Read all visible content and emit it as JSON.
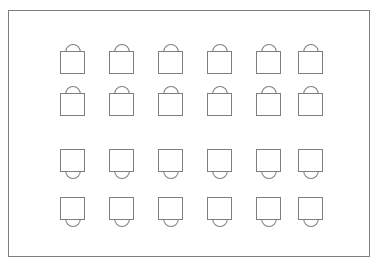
{
  "canvas": {
    "width": 380,
    "height": 269,
    "background_color": "#ffffff"
  },
  "frame": {
    "name": "outer-border-rectangle",
    "x": 8,
    "y": 10,
    "width": 362,
    "height": 247,
    "stroke_color": "#7f7f7f",
    "stroke_width": 1,
    "fill_color": "#ffffff"
  },
  "grid": {
    "rows": 4,
    "columns": 6,
    "total_icons": 24,
    "column_pitch": 49,
    "first_column_x": 60,
    "row_tops": [
      43,
      85,
      148,
      196
    ],
    "box_width": 23,
    "box_height": 21,
    "arc_width": 14,
    "arc_height": 7,
    "stroke_color": "#7f7f7f"
  },
  "icons": [
    {
      "row": 1,
      "column": 1,
      "name": "bag-icon-r1c1",
      "shape": "square-with-arc-above",
      "x": 60,
      "y": 43
    },
    {
      "row": 1,
      "column": 2,
      "name": "bag-icon-r1c2",
      "shape": "square-with-arc-above",
      "x": 109,
      "y": 43
    },
    {
      "row": 1,
      "column": 3,
      "name": "bag-icon-r1c3",
      "shape": "square-with-arc-above",
      "x": 158,
      "y": 43
    },
    {
      "row": 1,
      "column": 4,
      "name": "bag-icon-r1c4",
      "shape": "square-with-arc-above",
      "x": 207,
      "y": 43
    },
    {
      "row": 1,
      "column": 5,
      "name": "bag-icon-r1c5",
      "shape": "square-with-arc-above",
      "x": 256,
      "y": 43
    },
    {
      "row": 1,
      "column": 6,
      "name": "bag-icon-r1c6",
      "shape": "square-with-arc-above",
      "x": 298,
      "y": 43
    },
    {
      "row": 2,
      "column": 1,
      "name": "bag-icon-r2c1",
      "shape": "square-with-arc-above",
      "x": 60,
      "y": 85
    },
    {
      "row": 2,
      "column": 2,
      "name": "bag-icon-r2c2",
      "shape": "square-with-arc-above",
      "x": 109,
      "y": 85
    },
    {
      "row": 2,
      "column": 3,
      "name": "bag-icon-r2c3",
      "shape": "square-with-arc-above",
      "x": 158,
      "y": 85
    },
    {
      "row": 2,
      "column": 4,
      "name": "bag-icon-r2c4",
      "shape": "square-with-arc-above",
      "x": 207,
      "y": 85
    },
    {
      "row": 2,
      "column": 5,
      "name": "bag-icon-r2c5",
      "shape": "square-with-arc-above",
      "x": 256,
      "y": 85
    },
    {
      "row": 2,
      "column": 6,
      "name": "bag-icon-r2c6",
      "shape": "square-with-arc-above",
      "x": 298,
      "y": 85
    },
    {
      "row": 3,
      "column": 1,
      "name": "bulb-icon-r3c1",
      "shape": "square-with-arc-below",
      "x": 60,
      "y": 148
    },
    {
      "row": 3,
      "column": 2,
      "name": "bulb-icon-r3c2",
      "shape": "square-with-arc-below",
      "x": 109,
      "y": 148
    },
    {
      "row": 3,
      "column": 3,
      "name": "bulb-icon-r3c3",
      "shape": "square-with-arc-below",
      "x": 158,
      "y": 148
    },
    {
      "row": 3,
      "column": 4,
      "name": "bulb-icon-r3c4",
      "shape": "square-with-arc-below",
      "x": 207,
      "y": 148
    },
    {
      "row": 3,
      "column": 5,
      "name": "bulb-icon-r3c5",
      "shape": "square-with-arc-below",
      "x": 256,
      "y": 148
    },
    {
      "row": 3,
      "column": 6,
      "name": "bulb-icon-r3c6",
      "shape": "square-with-arc-below",
      "x": 298,
      "y": 148
    },
    {
      "row": 4,
      "column": 1,
      "name": "bulb-icon-r4c1",
      "shape": "square-with-arc-below",
      "x": 60,
      "y": 196
    },
    {
      "row": 4,
      "column": 2,
      "name": "bulb-icon-r4c2",
      "shape": "square-with-arc-below",
      "x": 109,
      "y": 196
    },
    {
      "row": 4,
      "column": 3,
      "name": "bulb-icon-r4c3",
      "shape": "square-with-arc-below",
      "x": 158,
      "y": 196
    },
    {
      "row": 4,
      "column": 4,
      "name": "bulb-icon-r4c4",
      "shape": "square-with-arc-below",
      "x": 207,
      "y": 196
    },
    {
      "row": 4,
      "column": 5,
      "name": "bulb-icon-r4c5",
      "shape": "square-with-arc-below",
      "x": 256,
      "y": 196
    },
    {
      "row": 4,
      "column": 6,
      "name": "bulb-icon-r4c6",
      "shape": "square-with-arc-below",
      "x": 298,
      "y": 196
    }
  ]
}
